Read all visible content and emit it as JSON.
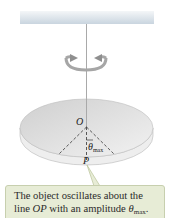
{
  "figure": {
    "labels": {
      "pivot": "O",
      "point": "P",
      "angle_symbol": "θ",
      "angle_subscript": "max"
    },
    "colors": {
      "ceiling_top": "#f4f6f8",
      "ceiling_bottom": "#c9d5df",
      "wire": "#a9a9a9",
      "disc_top": "#dcdcdc",
      "disc_edge": "#efefef",
      "arrow": "#9a9a9a",
      "callout_bg": "#e7ecd6",
      "callout_border": "#c7cfae"
    }
  },
  "callout": {
    "line1": "The object oscillates about the",
    "line2_prefix": "line ",
    "line2_italic": "OP",
    "line2_mid": " with an amplitude ",
    "line2_theta": "θ",
    "line2_sub": "max",
    "line2_end": "."
  }
}
